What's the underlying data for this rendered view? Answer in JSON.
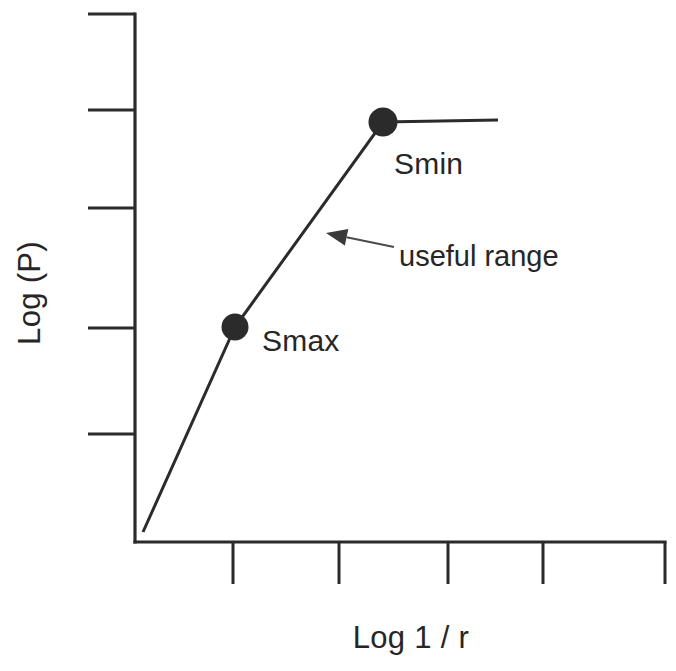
{
  "chart_data": {
    "type": "line",
    "title": "",
    "subtitle": "",
    "xlabel": "Log 1 / r",
    "ylabel": "Log (P)",
    "grid": false,
    "legend": "none",
    "axes": {
      "x": {
        "label": "Log 1 / r",
        "tick_labels": [],
        "tick_count": 5,
        "tick_positions_px": [
          233,
          339,
          448,
          543,
          665
        ],
        "axis_y_px": 542,
        "axis_start_px": 135,
        "axis_end_px": 665,
        "tick_length_px": 42,
        "tick_direction": "outward-down"
      },
      "y": {
        "label": "Log (P)",
        "tick_labels": [],
        "tick_count": 5,
        "tick_positions_px": [
          14,
          110,
          208,
          328,
          434
        ],
        "axis_x_px": 135,
        "axis_start_px": 14,
        "axis_end_px": 542,
        "tick_length_px": 47,
        "tick_direction": "outward-left"
      }
    },
    "series": [
      {
        "name": "pressure response",
        "style": "piecewise-linear",
        "points_px": [
          [
            143,
            532
          ],
          [
            235,
            327
          ],
          [
            383,
            122
          ],
          [
            498,
            120
          ]
        ],
        "segments": [
          {
            "name": "steep-rise-below-Smax",
            "from_px": [
              143,
              532
            ],
            "to_px": [
              235,
              327
            ]
          },
          {
            "name": "useful-range",
            "from_px": [
              235,
              327
            ],
            "to_px": [
              383,
              122
            ]
          },
          {
            "name": "plateau-above-Smin",
            "from_px": [
              383,
              122
            ],
            "to_px": [
              498,
              120
            ]
          }
        ]
      }
    ],
    "markers": [
      {
        "name": "Smax",
        "label": "Smax",
        "center_px": [
          235,
          327
        ],
        "radius_px": 13.5,
        "color": "#2b2b2b",
        "label_px": [
          262,
          351
        ]
      },
      {
        "name": "Smin",
        "label": "Smin",
        "center_px": [
          383,
          122
        ],
        "radius_px": 14.5,
        "color": "#2b2b2b",
        "label_px": [
          394,
          174
        ]
      }
    ],
    "annotations": [
      {
        "name": "useful-range",
        "text": "useful range",
        "text_px": [
          399,
          266
        ],
        "arrow_tail_px": [
          394,
          247
        ],
        "arrow_tip_px": [
          326,
          233
        ],
        "color": "#262626"
      }
    ],
    "colors": {
      "line": "#2b2b2b",
      "marker": "#2b2b2b",
      "axis": "#2b2b2b",
      "text": "#262626",
      "annotation": "#4a4a4a",
      "background": "#ffffff"
    }
  },
  "figure": {
    "background": "#ffffff",
    "axis_labels": {
      "y": "Log (P)",
      "x": "Log 1 / r"
    },
    "point_labels": {
      "smax": "Smax",
      "smin": "Smin"
    },
    "annotation": {
      "useful_range": "useful range"
    }
  }
}
